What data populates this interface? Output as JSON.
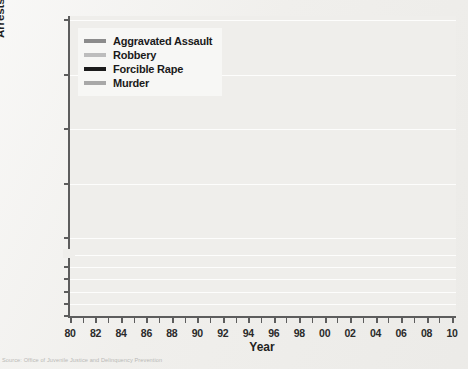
{
  "figure": {
    "y_axis_title": "Arrests per 100,000 Juveniles, Aged 10–17",
    "x_axis_title": "Year",
    "source_note": "Source: Office of Juvenile Justice and Delinquency Prevention"
  },
  "legend": {
    "items": [
      {
        "label": "Aggravated Assault",
        "color": "#8c8c8c"
      },
      {
        "label": "Robbery",
        "color": "#bdbdbd"
      },
      {
        "label": "Forcible Rape",
        "color": "#1c1c1c"
      },
      {
        "label": "Murder",
        "color": "#a8a8a8"
      }
    ]
  },
  "chart_data": {
    "type": "line",
    "title": "",
    "xlabel": "Year",
    "ylabel": "Arrests per 100,000 Juveniles, Aged 10–17",
    "grid": true,
    "legend_position": "top-left",
    "broken_axis": true,
    "axis_upper": {
      "ticks": [
        100,
        150,
        200,
        250,
        300
      ],
      "range": [
        100,
        300
      ]
    },
    "axis_lower": {
      "ticks": [
        0,
        5,
        10,
        15,
        20,
        25
      ],
      "range": [
        0,
        25
      ]
    },
    "x": [
      1980,
      1981,
      1982,
      1983,
      1984,
      1985,
      1986,
      1987,
      1988,
      1989,
      1990,
      1991,
      1992,
      1993,
      1994,
      1995,
      1996,
      1997,
      1998,
      1999,
      2000,
      2001,
      2002,
      2003,
      2004,
      2005,
      2006,
      2007,
      2008,
      2009
    ],
    "x_tick_labels": [
      "80",
      "82",
      "84",
      "86",
      "88",
      "90",
      "92",
      "94",
      "96",
      "98",
      "00",
      "02",
      "04",
      "06",
      "08",
      "10"
    ],
    "series": [
      {
        "name": "Aggravated Assault",
        "color": "#8c8c8c",
        "values": [
          145,
          140,
          133,
          127,
          137,
          130,
          140,
          134,
          147,
          160,
          185,
          205,
          228,
          248,
          268,
          278,
          286,
          272,
          252,
          238,
          222,
          210,
          196,
          185,
          178,
          172,
          173,
          168,
          160,
          148
        ]
      },
      {
        "name": "Robbery",
        "color": "#bdbdbd",
        "values": [
          170,
          160,
          150,
          143,
          139,
          140,
          138,
          128,
          118,
          122,
          137,
          158,
          170,
          178,
          190,
          198,
          200,
          178,
          150,
          126,
          110,
          100,
          92,
          86,
          78,
          97,
          102,
          100,
          100,
          92
        ]
      },
      {
        "name": "Forcible Rape",
        "color": "#1c1c1c",
        "values": [
          16.0,
          16.2,
          16.5,
          16.8,
          17.0,
          18.0,
          19.5,
          20.0,
          20.6,
          21.0,
          20.8,
          20.3,
          21.2,
          22.0,
          22.6,
          21.8,
          22.4,
          21.0,
          19.8,
          18.8,
          18.0,
          17.4,
          16.5,
          15.8,
          15.6,
          14.6,
          13.9,
          12.2,
          11.0,
          10.0
        ]
      },
      {
        "name": "Murder",
        "color": "#a8a8a8",
        "values": [
          6.5,
          6.4,
          6.0,
          5.6,
          5.4,
          5.8,
          6.5,
          7.0,
          8.0,
          9.0,
          10.5,
          11.5,
          11.8,
          11.3,
          13.8,
          12.0,
          10.0,
          8.3,
          6.6,
          5.4,
          4.8,
          4.6,
          4.4,
          4.3,
          4.3,
          4.3,
          4.4,
          4.4,
          4.3,
          4.0
        ]
      }
    ]
  }
}
